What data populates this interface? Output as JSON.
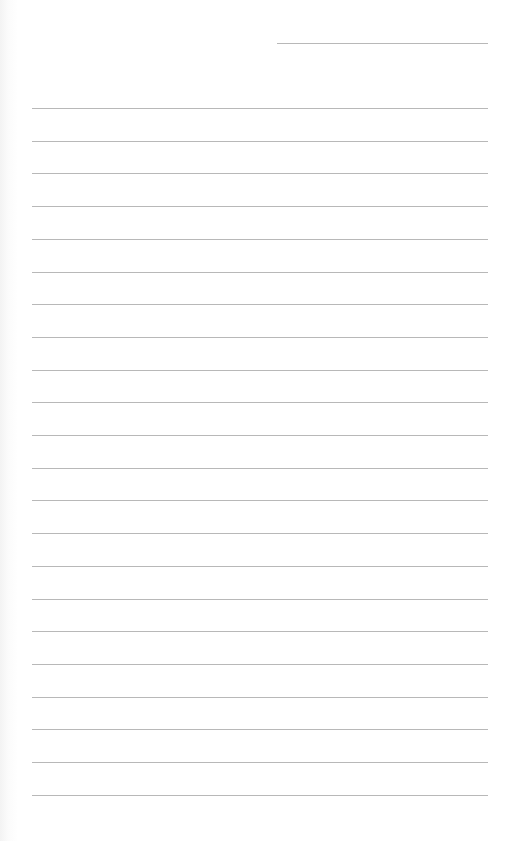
{
  "page": {
    "type": "lined-paper",
    "background_color": "#ffffff",
    "line_color": "#b8b8b8"
  },
  "header": {
    "date_line": {
      "x": 277,
      "y": 43,
      "width": 211
    }
  },
  "ruled_lines": {
    "count": 22,
    "start_y": 108,
    "spacing": 32.7,
    "left": 32,
    "width": 456
  }
}
